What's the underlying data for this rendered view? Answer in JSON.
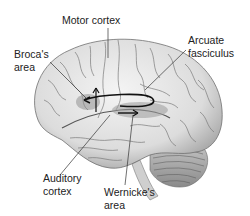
{
  "diagram": {
    "type": "brain-lateral-view",
    "labels": {
      "motor_cortex": "Motor cortex",
      "broca_line1": "Broca's",
      "broca_line2": "area",
      "arcuate_line1": "Arcuate",
      "arcuate_line2": "fasciculus",
      "auditory_line1": "Auditory",
      "auditory_line2": "cortex",
      "wernicke_line1": "Wernicke's",
      "wernicke_line2": "area"
    },
    "colors": {
      "brain_fill": "#e6e6e6",
      "gyri_line": "#6e6e6e",
      "highlight_region": "#9a9a9a",
      "arrow": "#111111",
      "leader_line": "#333333"
    }
  }
}
